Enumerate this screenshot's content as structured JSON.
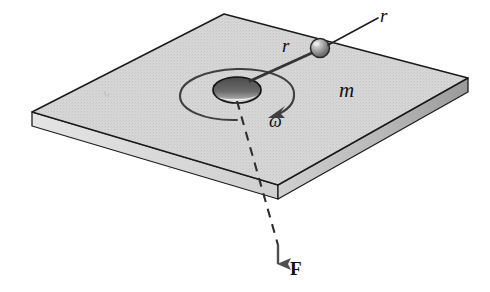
{
  "figure": {
    "background_color": "#ffffff"
  },
  "labels": {
    "radius_string": "r",
    "radius_leader": "r",
    "mass": "m",
    "angular_velocity": "ω",
    "force": "F"
  },
  "colors": {
    "plate_top": "#d3d3d3",
    "plate_side": "#cdcdcd",
    "plate_front_edge": "#bfbfbf",
    "outline": "#1a1a1a",
    "hole_fill": "#555555",
    "hole_highlight": "#f6f6f6",
    "ball_light": "#d8d8d8",
    "ball_dark": "#6a6a6a",
    "arrow": "#4a4a4a",
    "string": "#3a3a3a"
  },
  "geometry": {
    "plate_corners": {
      "top": [
        224,
        14
      ],
      "right": [
        468,
        78
      ],
      "front": [
        278,
        185
      ],
      "left": [
        32,
        112
      ]
    },
    "plate_thickness": 14,
    "hole_center": [
      237,
      90
    ],
    "hole_rx": 24,
    "hole_ry": 13,
    "ball_center": [
      320,
      48
    ],
    "ball_radius": 9.5,
    "string_from": [
      252,
      80
    ],
    "string_to": [
      313,
      53
    ],
    "leader_from": [
      378,
      18
    ],
    "leader_to": [
      329,
      44
    ],
    "spin_arc_rx": 54,
    "spin_arc_ry": 29,
    "force_line_top": [
      238,
      100
    ],
    "force_line_bottom": [
      278,
      272
    ],
    "force_arrow_tip": [
      278,
      272
    ]
  }
}
